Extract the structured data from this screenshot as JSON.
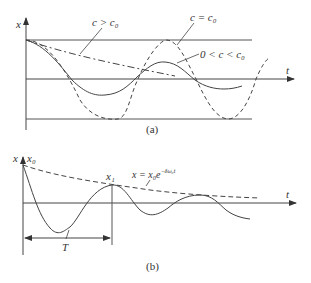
{
  "figure_a": {
    "caption": "(a)",
    "y_axis_label": "x",
    "x_axis_label": "t",
    "curve_labels": {
      "overdamped": "c > c₀",
      "undamped": "c = c₀",
      "underdamped": "0 < c < c₀"
    }
  },
  "figure_b": {
    "caption": "(b)",
    "y_axis_label": "x",
    "x_axis_label": "t",
    "initial_label": "x₀",
    "peak_label": "x₁",
    "envelope_label": "x = x₀e",
    "envelope_exponent": "−δω₀t",
    "period_label": "T"
  },
  "colors": {
    "line": "#444444",
    "background": "#ffffff"
  }
}
